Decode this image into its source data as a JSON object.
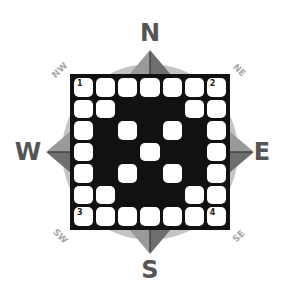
{
  "puzzle": {
    "type": "crossword-grid",
    "rows": 7,
    "cols": 7,
    "pattern": [
      "WWWWWWW",
      "WWBBBWW",
      "WBWBWBW",
      "WBBWBBW",
      "WBWBWBW",
      "WWBBBWW",
      "WWWWWWW"
    ],
    "numbers": [
      {
        "row": 0,
        "col": 0,
        "label": "1"
      },
      {
        "row": 0,
        "col": 6,
        "label": "2"
      },
      {
        "row": 6,
        "col": 0,
        "label": "3"
      },
      {
        "row": 6,
        "col": 6,
        "label": "4"
      }
    ]
  },
  "compass": {
    "cardinals": {
      "north": "N",
      "south": "S",
      "east": "E",
      "west": "W"
    },
    "intercardinals": {
      "northwest": "NW",
      "northeast": "NE",
      "southwest": "SW",
      "southeast": "SE"
    },
    "colors": {
      "circle": "#c4c4c4",
      "arrow_dark": "#6e6e6e",
      "arrow_light": "#9a9a9a",
      "cardinal_text": "#555555",
      "intercardinal_text": "#a8a8a8",
      "grid_black": "#111111"
    }
  }
}
